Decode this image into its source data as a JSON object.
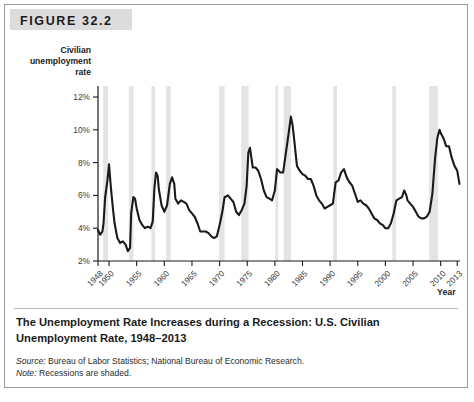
{
  "figure": {
    "banner_label": "FIGURE 32.2",
    "caption_title": "The Unemployment Rate Increases during a Recession: U.S. Civilian Unemployment Rate, 1948–2013",
    "source_prefix": "Source:",
    "source_text": " Bureau of Labor Statistics; National Bureau of Economic Research.",
    "note_prefix": "Note:",
    "note_text": " Recessions are shaded."
  },
  "chart_data": {
    "type": "line",
    "title": "The Unemployment Rate Increases during a Recession: U.S. Civilian Unemployment Rate, 1948–2013",
    "ylabel": "Civilian unemployment rate",
    "xlabel": "Year",
    "ylabel_lines": [
      "Civilian",
      "unemployment",
      "rate"
    ],
    "xlim": [
      1948,
      2013.5
    ],
    "ylim": [
      2,
      12
    ],
    "grid": false,
    "legend": null,
    "line_color": "#1a1a1a",
    "recession_band_color": "#e4e4e4",
    "yticks": [
      2,
      4,
      6,
      8,
      10,
      12
    ],
    "ytick_labels": [
      "2%",
      "4%",
      "6%",
      "8%",
      "10%",
      "12%"
    ],
    "xticks": [
      1948,
      1950,
      1955,
      1960,
      1965,
      1970,
      1975,
      1980,
      1985,
      1990,
      1995,
      2000,
      2005,
      2010,
      2013
    ],
    "xtick_labels": [
      "1948",
      "1950",
      "1955",
      "1960",
      "1965",
      "1970",
      "1975",
      "1980",
      "1985",
      "1990",
      "1995",
      "2000",
      "2005",
      "2010",
      "2013"
    ],
    "recessions": [
      {
        "start": 1948.92,
        "end": 1949.83
      },
      {
        "start": 1953.58,
        "end": 1954.42
      },
      {
        "start": 1957.67,
        "end": 1958.33
      },
      {
        "start": 1960.33,
        "end": 1961.17
      },
      {
        "start": 1969.92,
        "end": 1970.92
      },
      {
        "start": 1973.92,
        "end": 1975.25
      },
      {
        "start": 1980.08,
        "end": 1980.58
      },
      {
        "start": 1981.58,
        "end": 1982.92
      },
      {
        "start": 1990.58,
        "end": 1991.25
      },
      {
        "start": 2001.25,
        "end": 2001.92
      },
      {
        "start": 2007.92,
        "end": 2009.5
      }
    ],
    "x": [
      1948.0,
      1948.4,
      1948.8,
      1949.0,
      1949.3,
      1949.7,
      1950.0,
      1950.3,
      1950.7,
      1951.0,
      1951.5,
      1952.0,
      1952.5,
      1953.0,
      1953.4,
      1953.8,
      1954.0,
      1954.4,
      1954.7,
      1955.0,
      1955.5,
      1956.0,
      1956.5,
      1957.0,
      1957.5,
      1957.9,
      1958.2,
      1958.5,
      1958.8,
      1959.0,
      1959.5,
      1960.0,
      1960.5,
      1961.0,
      1961.4,
      1961.8,
      1962.0,
      1962.5,
      1963.0,
      1963.5,
      1964.0,
      1964.5,
      1965.0,
      1965.5,
      1966.0,
      1966.5,
      1967.0,
      1967.5,
      1968.0,
      1968.5,
      1969.0,
      1969.5,
      1970.0,
      1970.5,
      1970.9,
      1971.0,
      1971.5,
      1972.0,
      1972.5,
      1973.0,
      1973.5,
      1974.0,
      1974.5,
      1974.9,
      1975.2,
      1975.5,
      1976.0,
      1976.5,
      1977.0,
      1977.5,
      1978.0,
      1978.5,
      1979.0,
      1979.5,
      1980.0,
      1980.4,
      1980.7,
      1981.0,
      1981.5,
      1982.0,
      1982.5,
      1982.9,
      1983.2,
      1983.5,
      1984.0,
      1984.5,
      1985.0,
      1985.5,
      1986.0,
      1986.5,
      1987.0,
      1987.5,
      1988.0,
      1988.5,
      1989.0,
      1989.5,
      1990.0,
      1990.5,
      1991.0,
      1991.5,
      1992.0,
      1992.5,
      1993.0,
      1993.5,
      1994.0,
      1994.5,
      1995.0,
      1995.5,
      1996.0,
      1996.5,
      1997.0,
      1997.5,
      1998.0,
      1998.5,
      1999.0,
      1999.5,
      2000.0,
      2000.5,
      2001.0,
      2001.5,
      2002.0,
      2002.5,
      2003.0,
      2003.4,
      2003.8,
      2004.0,
      2004.5,
      2005.0,
      2005.5,
      2006.0,
      2006.5,
      2007.0,
      2007.5,
      2008.0,
      2008.5,
      2009.0,
      2009.4,
      2009.8,
      2010.0,
      2010.5,
      2011.0,
      2011.5,
      2012.0,
      2012.5,
      2013.0,
      2013.4
    ],
    "values": [
      3.9,
      3.6,
      3.8,
      4.3,
      5.9,
      6.9,
      7.9,
      6.6,
      5.2,
      4.3,
      3.4,
      3.1,
      3.2,
      3.0,
      2.6,
      2.8,
      4.9,
      5.9,
      5.8,
      5.2,
      4.5,
      4.2,
      4.0,
      4.1,
      4.0,
      4.4,
      6.4,
      7.4,
      7.2,
      6.4,
      5.4,
      5.0,
      5.4,
      6.7,
      7.1,
      6.7,
      5.8,
      5.5,
      5.7,
      5.6,
      5.5,
      5.1,
      4.9,
      4.7,
      4.3,
      3.8,
      3.8,
      3.8,
      3.7,
      3.5,
      3.4,
      3.5,
      4.2,
      5.0,
      5.9,
      5.9,
      6.0,
      5.8,
      5.6,
      5.0,
      4.8,
      5.1,
      5.5,
      6.6,
      8.6,
      8.9,
      7.7,
      7.7,
      7.5,
      7.0,
      6.3,
      5.9,
      5.8,
      5.7,
      6.3,
      7.6,
      7.5,
      7.4,
      7.4,
      8.6,
      9.8,
      10.8,
      10.3,
      9.4,
      7.8,
      7.5,
      7.3,
      7.2,
      7.0,
      7.0,
      6.6,
      6.0,
      5.7,
      5.5,
      5.2,
      5.3,
      5.4,
      5.5,
      6.8,
      6.9,
      7.4,
      7.6,
      7.1,
      6.8,
      6.6,
      6.1,
      5.6,
      5.7,
      5.5,
      5.4,
      5.2,
      4.9,
      4.6,
      4.5,
      4.3,
      4.2,
      4.0,
      4.0,
      4.3,
      4.9,
      5.7,
      5.8,
      5.9,
      6.3,
      6.0,
      5.7,
      5.5,
      5.3,
      5.0,
      4.7,
      4.6,
      4.6,
      4.7,
      5.0,
      6.1,
      8.3,
      9.5,
      10.0,
      9.8,
      9.5,
      9.0,
      9.0,
      8.3,
      7.8,
      7.5,
      6.7
    ]
  }
}
